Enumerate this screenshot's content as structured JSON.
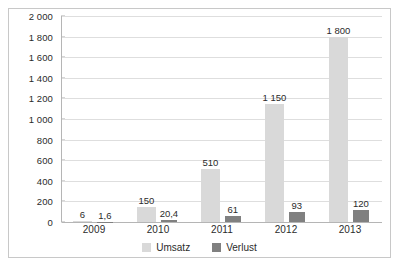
{
  "chart_data": {
    "type": "bar",
    "title": "",
    "subtitle": "",
    "xlabel": "",
    "ylabel": "",
    "categories": [
      "2009",
      "2010",
      "2011",
      "2012",
      "2013"
    ],
    "series": [
      {
        "name": "Umsatz",
        "color": "#d9d9d9",
        "values": [
          6,
          150,
          510,
          1150,
          1800
        ],
        "labels": [
          "6",
          "150",
          "510",
          "1 150",
          "1 800"
        ]
      },
      {
        "name": "Verlust",
        "color": "#808080",
        "values": [
          1.6,
          20.4,
          61,
          93,
          120
        ],
        "labels": [
          "1,6",
          "20,4",
          "61",
          "93",
          "120"
        ]
      }
    ],
    "ylim": [
      0,
      2000
    ],
    "ytick_step": 200,
    "ytick_labels": [
      "0",
      "200",
      "400",
      "600",
      "800",
      "1 000",
      "1 200",
      "1 400",
      "1 600",
      "1 800",
      "2 000"
    ],
    "ytick_values": [
      0,
      200,
      400,
      600,
      800,
      1000,
      1200,
      1400,
      1600,
      1800,
      2000
    ],
    "grid": true,
    "legend_position": "bottom",
    "legend": [
      "Umsatz",
      "Verlust"
    ]
  }
}
